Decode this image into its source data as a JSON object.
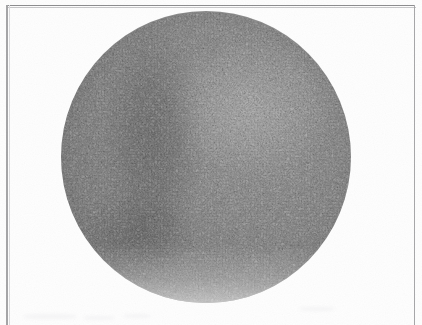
{
  "figure": {
    "kind": "halftone-photographic-plate",
    "medium": "printed-halftone-scan",
    "subject_description": "Circular disc rendered in coarse printing-screen stipple, resembling a photograph of a planetary body or a low-power microscope field.",
    "caption": "",
    "title": "",
    "page_background_hex": "#fefefe",
    "border": {
      "visible": true,
      "color_hex": "#9a9a9c",
      "left_x": 6,
      "top_y": 5,
      "right_x": 414,
      "thickness_px": 1
    },
    "disc": {
      "center_x": 206,
      "center_y": 157,
      "radius_px": 145,
      "left_edge_x": 61,
      "right_edge_x": 351,
      "top_edge_y": 11,
      "bottom_edge_y": 303,
      "mean_tone_hex": "#8d8d8d",
      "lightest_tone_hex": "#a6a6a6",
      "darkest_tone_hex": "#5f5f5f"
    },
    "texture": {
      "type": "stipple-halftone-grain",
      "grain_scale": "fine",
      "description": "Dense irregular worm-like dot clusters typical of a coarse letterpress screen."
    },
    "features": [
      {
        "name": "left-limb-shadow",
        "description": "Dark vertical crescent band along the left flank of the disc.",
        "center_x_pct": 32,
        "center_y_pct": 44,
        "relative_darkness": 0.26
      },
      {
        "name": "lower-left-dark-patch",
        "description": "Diffuse darker region in the lower-left quadrant.",
        "center_x_pct": 27,
        "center_y_pct": 77,
        "relative_darkness": 0.22
      },
      {
        "name": "upper-right-highlight",
        "description": "Brighter zone above and right of centre.",
        "center_x_pct": 66,
        "center_y_pct": 33,
        "relative_brightness": 0.2
      },
      {
        "name": "bottom-edge-fade",
        "description": "Lower rim of the disc dissolves softly into the page.",
        "center_x_pct": 50,
        "center_y_pct": 98,
        "relative_brightness": 0.3
      }
    ],
    "artifacts": [
      {
        "name": "scan-smudge",
        "location": "bottom-left margin",
        "legible_text": ""
      },
      {
        "name": "scan-smudge",
        "location": "bottom-right of disc",
        "legible_text": ""
      }
    ]
  }
}
